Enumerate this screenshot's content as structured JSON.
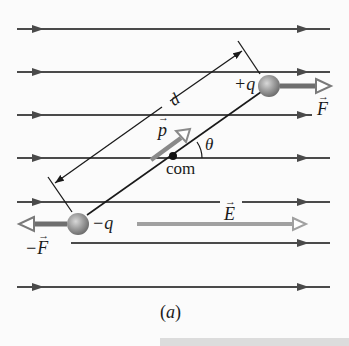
{
  "figure": {
    "caption": "(a)",
    "colors": {
      "field_line": "#4a4a4a",
      "force_arrow": "#6f6f6f",
      "dipole_vector": "#8a8a8a",
      "sphere": "#9a9a9a",
      "dimension_line": "#1a1a1a"
    },
    "field_lines_y": [
      29,
      72,
      115,
      158,
      202,
      243,
      287
    ],
    "labels": {
      "positive_charge": "+q",
      "negative_charge": "−q",
      "force": "F",
      "negative_force_sign": "−",
      "negative_force": "F",
      "field": "E",
      "dipole_moment": "p",
      "angle": "θ",
      "center_of_mass": "com",
      "separation": "d"
    }
  }
}
